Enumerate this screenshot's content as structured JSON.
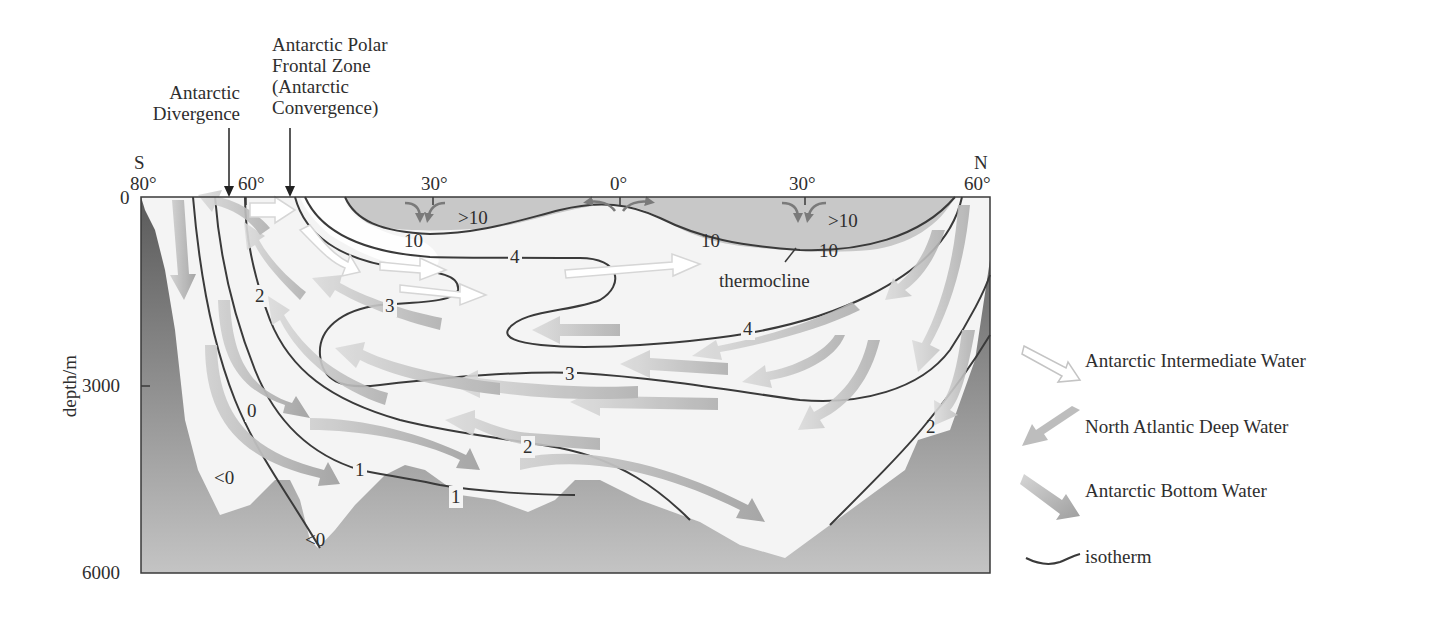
{
  "diagram": {
    "type": "oceanographic cross-section",
    "top_annotations": [
      {
        "id": "divergence",
        "lines": [
          "Antarctic",
          "Divergence"
        ]
      },
      {
        "id": "convergence",
        "lines": [
          "Antarctic Polar",
          "Frontal Zone",
          "(Antarctic",
          "Convergence)"
        ]
      }
    ],
    "hemisphere_labels": {
      "south": "S",
      "north": "N"
    },
    "latitude_ticks": [
      "80°",
      "60°",
      "30°",
      "0°",
      "30°",
      "60°"
    ],
    "depth_axis": {
      "title": "depth/m",
      "ticks": [
        "0",
        "3000",
        "6000"
      ]
    },
    "isotherm_labels": {
      "t10a": "10",
      "t10b": "10",
      "t10c": "10",
      "gt10a": ">10",
      "gt10b": ">10",
      "t4a": "4",
      "t4b": "4",
      "t3a": "3",
      "t3b": "3",
      "t2a": "2",
      "t2b": "2",
      "t2c": "2",
      "t1a": "1",
      "t1b": "1",
      "t0": "0",
      "lt0a": "<0",
      "lt0b": "<0"
    },
    "thermocline_label": "thermocline",
    "colors": {
      "seafloor_dark": "#555555",
      "seafloor_light": "#bdbdbd",
      "warm_layer": "#c9c9c9",
      "water": "#f3f3f3",
      "isotherm_line": "#3a3a3a",
      "nadw_arrow": "#b8b8b8",
      "aaiw_arrow": "#ffffff",
      "aabw_arrow": "#a9a9a9"
    }
  },
  "legend": {
    "items": [
      {
        "label": "Antarctic Intermediate Water",
        "icon": "hollow-arrow-icon"
      },
      {
        "label": "North Atlantic Deep Water",
        "icon": "grey-arrow-icon"
      },
      {
        "label": "Antarctic Bottom Water",
        "icon": "dark-grey-arrow-icon"
      },
      {
        "label": "isotherm",
        "icon": "wavy-line-icon"
      }
    ]
  }
}
